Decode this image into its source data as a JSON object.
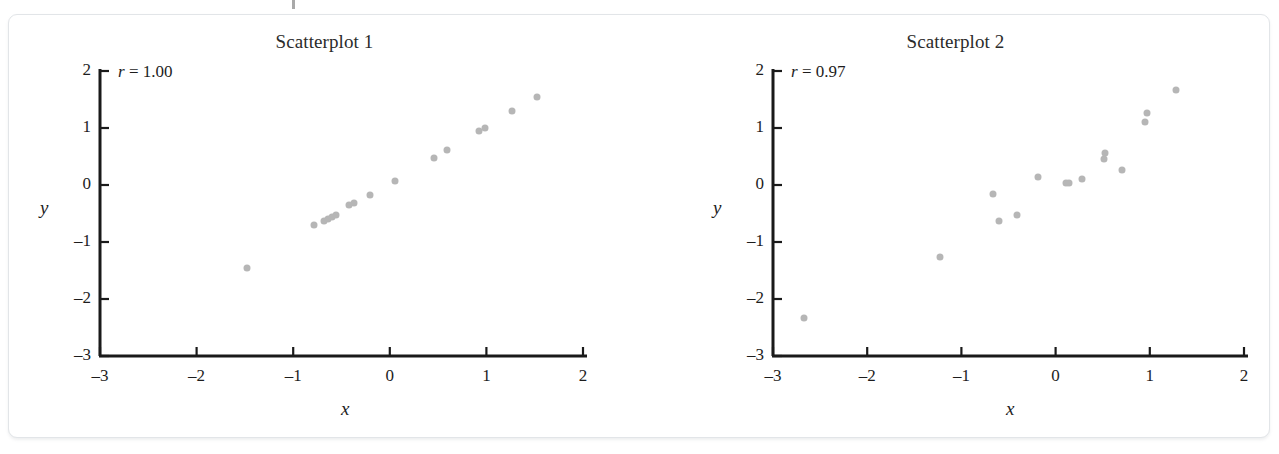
{
  "figure": {
    "background_color": "#ffffff",
    "card_border_color": "#e2e5e8",
    "dot_color": "#b6b6b6",
    "axis_color": "#1a1a1a"
  },
  "chart_data": [
    {
      "type": "scatter",
      "title": "Scatterplot 1",
      "xlabel": "x",
      "ylabel": "y",
      "xlim": [
        -3,
        2
      ],
      "ylim": [
        -3,
        2
      ],
      "xticks": [
        -3,
        -2,
        -1,
        0,
        1,
        2
      ],
      "yticks": [
        -3,
        -2,
        -1,
        0,
        1,
        2
      ],
      "xtick_labels": [
        "–3",
        "–2",
        "–1",
        "0",
        "1",
        "2"
      ],
      "ytick_labels": [
        "–3",
        "–2",
        "–1",
        "0",
        "1",
        "2"
      ],
      "grid": false,
      "legend": "none",
      "annotation": {
        "symbol": "r",
        "text": " = 1.00",
        "full": "r = 1.00",
        "value": 1.0
      },
      "points": [
        {
          "x": -1.48,
          "y": -1.45
        },
        {
          "x": -0.78,
          "y": -0.71
        },
        {
          "x": -0.68,
          "y": -0.63
        },
        {
          "x": -0.64,
          "y": -0.6
        },
        {
          "x": -0.6,
          "y": -0.56
        },
        {
          "x": -0.56,
          "y": -0.52
        },
        {
          "x": -0.42,
          "y": -0.35
        },
        {
          "x": -0.37,
          "y": -0.32
        },
        {
          "x": -0.21,
          "y": -0.18
        },
        {
          "x": 0.05,
          "y": 0.07
        },
        {
          "x": 0.46,
          "y": 0.48
        },
        {
          "x": 0.59,
          "y": 0.61
        },
        {
          "x": 0.92,
          "y": 0.95
        },
        {
          "x": 0.99,
          "y": 1.0
        },
        {
          "x": 1.27,
          "y": 1.29
        },
        {
          "x": 1.52,
          "y": 1.55
        }
      ]
    },
    {
      "type": "scatter",
      "title": "Scatterplot 2",
      "xlabel": "x",
      "ylabel": "y",
      "xlim": [
        -3,
        2
      ],
      "ylim": [
        -3,
        2
      ],
      "xticks": [
        -3,
        -2,
        -1,
        0,
        1,
        2
      ],
      "yticks": [
        -3,
        -2,
        -1,
        0,
        1,
        2
      ],
      "xtick_labels": [
        "–3",
        "–2",
        "–1",
        "0",
        "1",
        "2"
      ],
      "ytick_labels": [
        "–3",
        "–2",
        "–1",
        "0",
        "1",
        "2"
      ],
      "grid": false,
      "legend": "none",
      "annotation": {
        "symbol": "r",
        "text": " = 0.97",
        "full": "r = 0.97",
        "value": 0.97
      },
      "points": [
        {
          "x": -2.67,
          "y": -2.33
        },
        {
          "x": -1.23,
          "y": -1.27
        },
        {
          "x": -0.66,
          "y": -0.16
        },
        {
          "x": -0.6,
          "y": -0.64
        },
        {
          "x": -0.41,
          "y": -0.53
        },
        {
          "x": -0.19,
          "y": 0.14
        },
        {
          "x": 0.11,
          "y": 0.03
        },
        {
          "x": 0.14,
          "y": 0.04
        },
        {
          "x": 0.28,
          "y": 0.11
        },
        {
          "x": 0.51,
          "y": 0.46
        },
        {
          "x": 0.52,
          "y": 0.56
        },
        {
          "x": 0.71,
          "y": 0.27
        },
        {
          "x": 0.95,
          "y": 1.11
        },
        {
          "x": 0.97,
          "y": 1.27
        },
        {
          "x": 1.28,
          "y": 1.67
        }
      ]
    }
  ]
}
